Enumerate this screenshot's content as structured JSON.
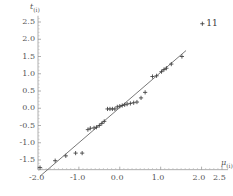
{
  "chart_data": {
    "type": "scatter",
    "title": "",
    "xlabel": "mu_(i)",
    "ylabel": "t_(i)",
    "xlabel_base": "μ",
    "xlabel_sub": "(i)",
    "ylabel_base": "t",
    "ylabel_sub": "(i)",
    "xlim": [
      -2.0,
      2.6
    ],
    "ylim": [
      -1.85,
      2.7
    ],
    "grid": false,
    "legend": "none",
    "xticks": [
      -2.0,
      -1.0,
      0.0,
      1.0,
      2.0,
      2.5
    ],
    "xtick_labels": [
      "-2.0",
      "-1.0",
      "0.0",
      "1.0",
      "2.0",
      "2.5"
    ],
    "yticks": [
      -1.5,
      -1.0,
      -0.5,
      0.0,
      0.5,
      1.0,
      1.5,
      2.0,
      2.5
    ],
    "ytick_labels": [
      "-1.5",
      "-1.0",
      "-0.5",
      "0.0",
      "0.5",
      "1.0",
      "1.5",
      "2.0",
      "2.5"
    ],
    "marker": "plus",
    "marker_color": "#3d3d3d",
    "line_color": "#555555",
    "reference_line": {
      "type": "line",
      "slope": 1.02,
      "intercept": 0.02,
      "x_start": -1.95,
      "x_end": 1.62
    },
    "annotations": [
      {
        "text": "11",
        "x": 2.02,
        "y": 2.45,
        "marker": "plus"
      }
    ],
    "points": [
      {
        "x": -1.95,
        "y": -1.72
      },
      {
        "x": -1.58,
        "y": -1.52
      },
      {
        "x": -1.32,
        "y": -1.38
      },
      {
        "x": -1.08,
        "y": -1.3
      },
      {
        "x": -0.92,
        "y": -1.3
      },
      {
        "x": -0.78,
        "y": -0.62
      },
      {
        "x": -0.72,
        "y": -0.58
      },
      {
        "x": -0.63,
        "y": -0.57
      },
      {
        "x": -0.57,
        "y": -0.55
      },
      {
        "x": -0.5,
        "y": -0.5
      },
      {
        "x": -0.44,
        "y": -0.44
      },
      {
        "x": -0.38,
        "y": -0.38
      },
      {
        "x": -0.3,
        "y": -0.02
      },
      {
        "x": -0.24,
        "y": -0.02
      },
      {
        "x": -0.18,
        "y": -0.02
      },
      {
        "x": -0.12,
        "y": -0.02
      },
      {
        "x": -0.06,
        "y": 0.04
      },
      {
        "x": 0.0,
        "y": 0.06
      },
      {
        "x": 0.06,
        "y": 0.08
      },
      {
        "x": 0.12,
        "y": 0.1
      },
      {
        "x": 0.18,
        "y": 0.12
      },
      {
        "x": 0.26,
        "y": 0.14
      },
      {
        "x": 0.34,
        "y": 0.16
      },
      {
        "x": 0.42,
        "y": 0.18
      },
      {
        "x": 0.52,
        "y": 0.3
      },
      {
        "x": 0.62,
        "y": 0.46
      },
      {
        "x": 0.8,
        "y": 0.92
      },
      {
        "x": 0.9,
        "y": 0.94
      },
      {
        "x": 1.02,
        "y": 1.06
      },
      {
        "x": 1.08,
        "y": 1.12
      },
      {
        "x": 1.14,
        "y": 1.16
      },
      {
        "x": 1.26,
        "y": 1.28
      },
      {
        "x": 1.52,
        "y": 1.5
      }
    ]
  },
  "annotation_label": "11"
}
